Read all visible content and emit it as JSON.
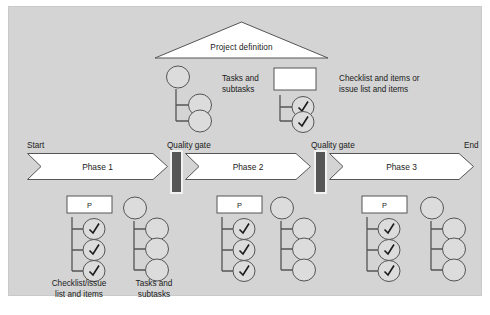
{
  "figure": {
    "title_shape_label": "Project definition",
    "legend": [
      {
        "id": "tasks",
        "icon": "task-tree-icon",
        "label": "Tasks and\nsubtasks"
      },
      {
        "id": "checklist",
        "icon": "checklist-tree-icon",
        "label": "Checklist and items or\nissue list and items"
      }
    ],
    "timeline": {
      "start_label": "Start",
      "end_label": "End",
      "phases": [
        {
          "id": "phase-1",
          "label": "Phase 1"
        },
        {
          "id": "phase-2",
          "label": "Phase 2"
        },
        {
          "id": "phase-3",
          "label": "Phase 3"
        }
      ],
      "gates": [
        {
          "id": "gate-1",
          "label": "Quality gate"
        },
        {
          "id": "gate-2",
          "label": "Quality gate"
        }
      ]
    },
    "phase_groups": [
      {
        "id": "group-phase-1",
        "checklist": {
          "header": "P",
          "items": [
            "check",
            "check",
            "check"
          ]
        },
        "tasks": {
          "root": "task",
          "children": [
            "subtask",
            "subtask",
            "subtask"
          ]
        }
      },
      {
        "id": "group-phase-2",
        "checklist": {
          "header": "P",
          "items": [
            "check",
            "check",
            "check"
          ]
        },
        "tasks": {
          "root": "task",
          "children": [
            "subtask",
            "subtask",
            "subtask"
          ]
        }
      },
      {
        "id": "group-phase-3",
        "checklist": {
          "header": "P",
          "items": [
            "check",
            "check",
            "check"
          ]
        },
        "tasks": {
          "root": "task",
          "children": [
            "subtask",
            "subtask",
            "subtask"
          ]
        }
      }
    ],
    "group_labels": [
      {
        "id": "checklist-issue",
        "text": "Checklist/issue\nlist and items"
      },
      {
        "id": "tasks-subtasks",
        "text": "Tasks and\nsubtasks"
      }
    ],
    "colors": {
      "panel_background": "#d4d4d4",
      "shape_fill": "#ffffff",
      "circle_fill": "#dcdcdc",
      "gate_fill": "#565656",
      "stroke": "#555555",
      "text": "#1a1a1a"
    }
  }
}
